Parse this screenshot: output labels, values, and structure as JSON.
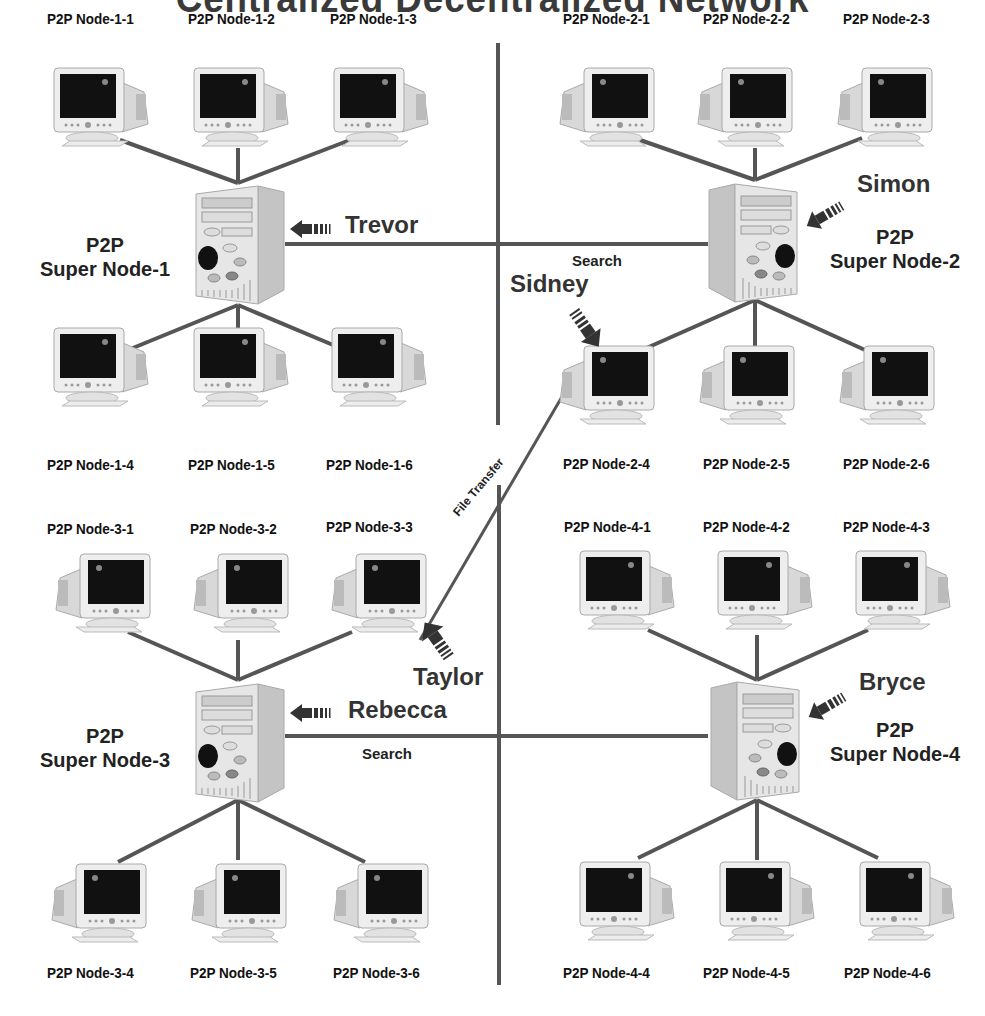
{
  "title": "Centralized Decentralized Network",
  "colors": {
    "wire": "#555555",
    "text": "#111111",
    "arrow": "#333333",
    "screen": "#111111",
    "case": "#e6e6e6"
  },
  "clusters": [
    {
      "super_node": {
        "line1": "P2P",
        "line2": "Super Node-1"
      },
      "user": "Trevor",
      "top_nodes": [
        "P2P Node-1-1",
        "P2P Node-1-2",
        "P2P Node-1-3"
      ],
      "bottom_nodes": [
        "P2P Node-1-4",
        "P2P Node-1-5",
        "P2P Node-1-6"
      ]
    },
    {
      "super_node": {
        "line1": "P2P",
        "line2": "Super Node-2"
      },
      "user": "Simon",
      "top_nodes": [
        "P2P Node-2-1",
        "P2P Node-2-2",
        "P2P Node-2-3"
      ],
      "bottom_nodes": [
        "P2P Node-2-4",
        "P2P Node-2-5",
        "P2P Node-2-6"
      ]
    },
    {
      "super_node": {
        "line1": "P2P",
        "line2": "Super Node-3"
      },
      "user": "Rebecca",
      "top_nodes": [
        "P2P Node-3-1",
        "P2P Node-3-2",
        "P2P Node-3-3"
      ],
      "bottom_nodes": [
        "P2P Node-3-4",
        "P2P Node-3-5",
        "P2P Node-3-6"
      ]
    },
    {
      "super_node": {
        "line1": "P2P",
        "line2": "Super Node-4"
      },
      "user": "Bryce",
      "top_nodes": [
        "P2P Node-4-1",
        "P2P Node-4-2",
        "P2P Node-4-3"
      ],
      "bottom_nodes": [
        "P2P Node-4-4",
        "P2P Node-4-5",
        "P2P Node-4-6"
      ]
    }
  ],
  "peer_users": {
    "node_2_4": "Sidney",
    "node_3_3": "Taylor"
  },
  "links": {
    "search_top": "Search",
    "search_bottom": "Search",
    "file_transfer": "File Transfer"
  }
}
